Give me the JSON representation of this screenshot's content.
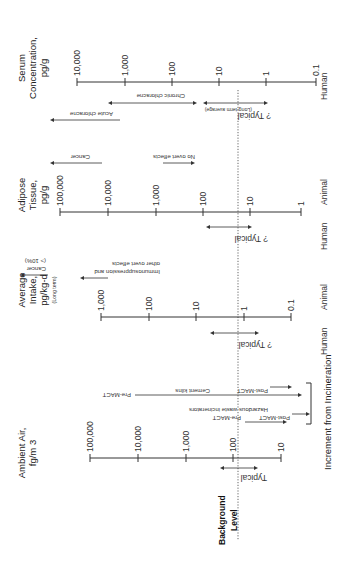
{
  "figure": {
    "orientation": "rotated 90 degrees (text reads bottom-to-top)",
    "background_label": {
      "line1": "Background",
      "line2": "Level"
    },
    "increment_label": "Increment from Incineration"
  },
  "panels": {
    "serum": {
      "title1": "Serum",
      "title2": "Concentration,",
      "title3": "pg/g",
      "ticks": [
        "10,000",
        "1,000",
        "100",
        "10",
        "1",
        "0.1"
      ],
      "species": "Human",
      "typical": "? Typical",
      "typical_note": "(Long-term average)",
      "chronic": "Chronic chloracne",
      "acute": "Acute chloracne"
    },
    "adipose": {
      "title1": "Adipose",
      "title2": "Tissue,",
      "title3": "pg/g",
      "ticks": [
        "100,000",
        "10,000",
        "1,000",
        "100",
        "10",
        "1"
      ],
      "species_human": "Human",
      "species_animal": "Animal",
      "typical": "? Typical",
      "cancer": "Cancer",
      "no_effects": "No overt effects"
    },
    "intake": {
      "title1": "Average",
      "title2": "Intake,",
      "title3": "pg/kg-d",
      "title4": "(Long term)",
      "ticks": [
        "1,000",
        "100",
        "10",
        "1",
        "0.1"
      ],
      "species_human": "Human",
      "species_animal": "Animal",
      "typical": "? Typical",
      "cancer": "Cancer",
      "cancer_note": "(> 10%)",
      "immuno1": "Immunosuppression and",
      "immuno2": "other overt effects"
    },
    "air": {
      "title1": "Ambient Air,",
      "title2": "fg/m 3",
      "ticks": [
        "100,000",
        "10,000",
        "1,000",
        "100",
        "10"
      ],
      "typical": "Typical",
      "cement_kilns": "Cement kilns",
      "hazardous": "Hazardous waste incinerators",
      "pre_mact": "Pre-MACT",
      "post_mact": "Post-MACT"
    }
  }
}
